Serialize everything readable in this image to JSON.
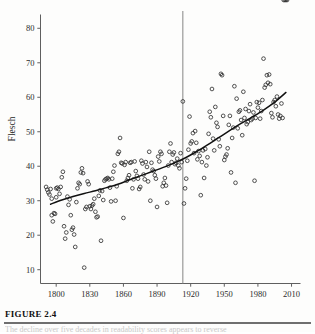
{
  "figure": {
    "number_label": "FIGURE 2.4",
    "caption_fragment": "The decline over five decades in readability scores appears to reverse"
  },
  "chart_data": {
    "type": "scatter",
    "title": "",
    "xlabel": "Year",
    "ylabel": "Flesch",
    "xlim": [
      1786,
      2018
    ],
    "ylim": [
      6,
      84
    ],
    "xticks": [
      1800,
      1830,
      1860,
      1890,
      1920,
      1950,
      1980,
      2010
    ],
    "xtick_labels": [
      "1800",
      "1830",
      "1860",
      "1890",
      "1920",
      "1950",
      "1980",
      "2010"
    ],
    "yticks": [
      10,
      20,
      30,
      40,
      50,
      60,
      70,
      80
    ],
    "ytick_labels": [
      "10",
      "20",
      "30",
      "40",
      "50",
      "60",
      "70",
      "80"
    ],
    "grid": false,
    "legend": null,
    "marker": "open-circle",
    "marker_color": "#333333",
    "annotations": [
      {
        "type": "vertical-line",
        "x": 1913,
        "color": "#8f8f8f",
        "label": ""
      }
    ],
    "trend": {
      "type": "loess-curve",
      "color": "#111111",
      "x": [
        1795,
        1805,
        1815,
        1825,
        1835,
        1845,
        1855,
        1865,
        1875,
        1885,
        1895,
        1905,
        1915,
        1925,
        1935,
        1945,
        1955,
        1965,
        1975,
        1985,
        1995,
        2005
      ],
      "y": [
        29.0,
        30.2,
        31.2,
        32.1,
        32.9,
        33.8,
        34.8,
        36.0,
        37.2,
        38.4,
        39.6,
        40.9,
        42.4,
        44.2,
        46.2,
        48.3,
        50.4,
        52.4,
        54.3,
        56.3,
        58.6,
        61.4
      ]
    },
    "x": [
      1791,
      1792,
      1793,
      1794,
      1795,
      1796,
      1796,
      1797,
      1798,
      1799,
      1800,
      1800,
      1801,
      1802,
      1803,
      1804,
      1805,
      1806,
      1807,
      1808,
      1809,
      1810,
      1811,
      1812,
      1813,
      1814,
      1815,
      1816,
      1817,
      1818,
      1819,
      1820,
      1821,
      1822,
      1823,
      1824,
      1825,
      1826,
      1827,
      1828,
      1829,
      1830,
      1831,
      1832,
      1833,
      1834,
      1835,
      1836,
      1837,
      1838,
      1839,
      1840,
      1841,
      1842,
      1843,
      1844,
      1845,
      1846,
      1847,
      1848,
      1849,
      1850,
      1851,
      1852,
      1853,
      1854,
      1855,
      1856,
      1857,
      1858,
      1859,
      1860,
      1861,
      1862,
      1863,
      1864,
      1865,
      1866,
      1867,
      1868,
      1869,
      1870,
      1871,
      1872,
      1873,
      1874,
      1875,
      1876,
      1877,
      1878,
      1879,
      1880,
      1881,
      1882,
      1883,
      1884,
      1885,
      1886,
      1887,
      1888,
      1889,
      1890,
      1891,
      1892,
      1893,
      1894,
      1895,
      1896,
      1897,
      1898,
      1899,
      1900,
      1901,
      1902,
      1903,
      1904,
      1905,
      1906,
      1907,
      1908,
      1909,
      1910,
      1911,
      1912,
      1913,
      1914,
      1915,
      1916,
      1917,
      1918,
      1919,
      1920,
      1921,
      1922,
      1923,
      1924,
      1925,
      1926,
      1927,
      1928,
      1929,
      1930,
      1931,
      1932,
      1933,
      1934,
      1935,
      1936,
      1937,
      1938,
      1939,
      1940,
      1941,
      1942,
      1943,
      1944,
      1945,
      1946,
      1947,
      1948,
      1949,
      1950,
      1951,
      1952,
      1953,
      1954,
      1955,
      1956,
      1957,
      1958,
      1959,
      1960,
      1961,
      1962,
      1963,
      1964,
      1965,
      1966,
      1967,
      1968,
      1969,
      1970,
      1971,
      1972,
      1973,
      1974,
      1975,
      1976,
      1977,
      1978,
      1979,
      1980,
      1981,
      1982,
      1983,
      1984,
      1985,
      1986,
      1987,
      1988,
      1989,
      1990,
      1991,
      1992,
      1993,
      1994,
      1995,
      1996,
      1997,
      1998,
      1999,
      2000,
      2001,
      2002,
      2003,
      2004,
      2005,
      2006
    ],
    "y": [
      34.0,
      33.2,
      32.4,
      31.8,
      33.4,
      30.6,
      25.8,
      24.0,
      26.4,
      26.2,
      33.6,
      31.0,
      33.8,
      33.4,
      32.0,
      34.0,
      36.8,
      38.4,
      22.6,
      19.0,
      20.8,
      31.2,
      28.8,
      30.4,
      25.8,
      21.6,
      22.2,
      20.2,
      16.6,
      29.6,
      33.6,
      35.2,
      34.8,
      38.2,
      39.4,
      38.0,
      10.6,
      27.6,
      28.2,
      35.6,
      34.8,
      28.4,
      27.6,
      28.6,
      29.0,
      30.6,
      26.8,
      25.2,
      25.4,
      31.4,
      33.0,
      18.4,
      32.8,
      30.2,
      35.8,
      36.2,
      36.4,
      36.6,
      36.2,
      33.8,
      29.8,
      36.4,
      38.4,
      40.2,
      30.0,
      34.2,
      43.6,
      44.2,
      48.2,
      41.0,
      40.8,
      25.0,
      40.4,
      41.2,
      35.8,
      36.6,
      37.4,
      41.0,
      41.2,
      33.6,
      36.2,
      41.4,
      38.6,
      37.2,
      36.4,
      33.4,
      34.0,
      41.6,
      40.8,
      37.6,
      36.2,
      41.2,
      39.8,
      35.6,
      44.2,
      30.0,
      41.0,
      39.0,
      38.6,
      37.4,
      36.4,
      28.2,
      42.8,
      41.4,
      44.2,
      43.6,
      34.2,
      35.2,
      36.6,
      34.4,
      29.4,
      40.2,
      44.2,
      46.6,
      41.2,
      43.4,
      44.0,
      40.6,
      41.0,
      42.2,
      40.2,
      39.4,
      43.8,
      41.2,
      58.8,
      29.2,
      33.6,
      36.4,
      41.6,
      44.8,
      54.4,
      46.6,
      47.2,
      49.6,
      43.8,
      50.2,
      46.8,
      42.0,
      44.4,
      43.0,
      31.6,
      41.2,
      44.6,
      36.6,
      45.0,
      40.2,
      42.6,
      49.4,
      55.8,
      54.2,
      62.4,
      48.0,
      44.6,
      57.2,
      52.6,
      51.4,
      47.8,
      45.8,
      66.8,
      66.4,
      54.6,
      41.8,
      42.8,
      43.4,
      45.2,
      52.0,
      54.6,
      38.2,
      48.2,
      51.2,
      63.2,
      35.2,
      59.6,
      51.0,
      55.8,
      56.2,
      53.4,
      49.0,
      61.6,
      54.0,
      56.6,
      52.2,
      52.8,
      56.0,
      58.0,
      53.4,
      53.8,
      55.6,
      35.8,
      54.0,
      58.6,
      57.0,
      58.4,
      53.8,
      56.0,
      59.2,
      71.2,
      62.8,
      63.6,
      66.4,
      64.2,
      66.6,
      63.8,
      55.4,
      54.2,
      58.6,
      59.2,
      57.4,
      60.2,
      55.0,
      53.8,
      54.6,
      58.2,
      54.0
    ]
  }
}
